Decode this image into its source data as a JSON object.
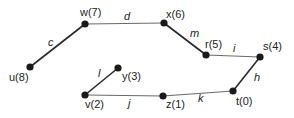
{
  "diagram": {
    "type": "graph",
    "nodes": [
      {
        "id": "w",
        "label": "w(7)",
        "x": 85,
        "y": 24,
        "lx": 80,
        "ly": 16
      },
      {
        "id": "u",
        "label": "u(8)",
        "x": 30,
        "y": 67,
        "lx": 9,
        "ly": 81
      },
      {
        "id": "x",
        "label": "x(6)",
        "x": 164,
        "y": 23,
        "lx": 166,
        "ly": 18
      },
      {
        "id": "r",
        "label": "r(5)",
        "x": 206,
        "y": 55,
        "lx": 205,
        "ly": 48
      },
      {
        "id": "s",
        "label": "s(4)",
        "x": 260,
        "y": 57,
        "lx": 263,
        "ly": 50
      },
      {
        "id": "t",
        "label": "t(0)",
        "x": 233,
        "y": 91,
        "lx": 236,
        "ly": 105
      },
      {
        "id": "z",
        "label": "z(1)",
        "x": 163,
        "y": 96,
        "lx": 166,
        "ly": 108
      },
      {
        "id": "v",
        "label": "v(2)",
        "x": 85,
        "y": 95,
        "lx": 85,
        "ly": 108
      },
      {
        "id": "y",
        "label": "y(3)",
        "x": 118,
        "y": 68,
        "lx": 122,
        "ly": 80
      }
    ],
    "edges": [
      {
        "from": "u",
        "to": "w",
        "label": "c",
        "lx": 48,
        "ly": 46,
        "style": "thick"
      },
      {
        "from": "w",
        "to": "x",
        "label": "d",
        "lx": 124,
        "ly": 20,
        "style": "thin"
      },
      {
        "from": "x",
        "to": "r",
        "label": "m",
        "lx": 190,
        "ly": 37,
        "style": "thick"
      },
      {
        "from": "r",
        "to": "s",
        "label": "i",
        "lx": 233,
        "ly": 52,
        "style": "thin"
      },
      {
        "from": "s",
        "to": "t",
        "label": "h",
        "lx": 254,
        "ly": 81,
        "style": "thick"
      },
      {
        "from": "t",
        "to": "z",
        "label": "k",
        "lx": 198,
        "ly": 102,
        "style": "thin"
      },
      {
        "from": "z",
        "to": "v",
        "label": "j",
        "lx": 128,
        "ly": 107,
        "style": "thin"
      },
      {
        "from": "v",
        "to": "y",
        "label": "l",
        "lx": 98,
        "ly": 77,
        "style": "thick"
      }
    ]
  }
}
